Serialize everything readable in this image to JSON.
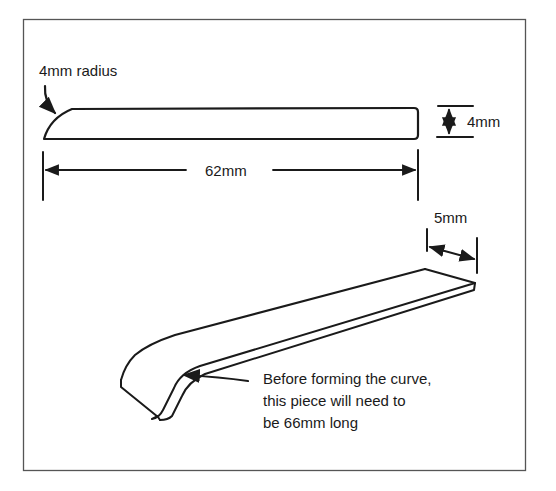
{
  "diagram": {
    "title": "",
    "colors": {
      "line": "#1a1a1a",
      "frame": "#555555",
      "background": "#ffffff"
    },
    "top_view": {
      "radius_label": "4mm radius",
      "height_label": "4mm",
      "length_label": "62mm"
    },
    "perspective_view": {
      "width_label": "5mm",
      "note_lines": [
        "Before forming the curve,",
        "this piece will need to",
        "be 66mm long"
      ]
    }
  }
}
